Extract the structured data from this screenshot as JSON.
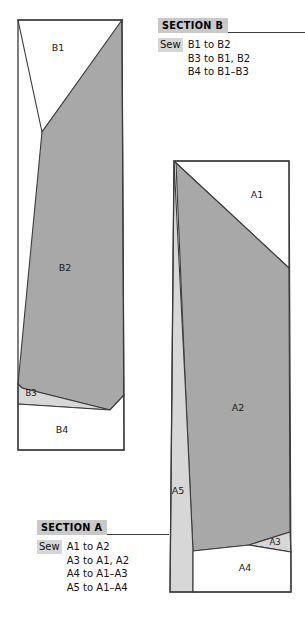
{
  "document": {
    "kind": "sewing-pattern-diagram",
    "background_color": "#ffffff"
  },
  "palette": {
    "mid_gray": "#a8a8a8",
    "light_gray": "#d7d7d7",
    "white": "#ffffff",
    "outline": "#3b3b3b",
    "title_highlight": "#c9c9c9",
    "sew_highlight": "#d6d6d6",
    "text": "#111111"
  },
  "sections": [
    {
      "id": "section-b",
      "title": "SECTION B",
      "sew_label": "Sew",
      "sew_lines": [
        "B1 to B2",
        "B3 to B1, B2",
        "B4 to B1–B3"
      ]
    },
    {
      "id": "section-a",
      "title": "SECTION A",
      "sew_label": "Sew",
      "sew_lines": [
        "A1 to A2",
        "A3 to A1, A2",
        "A4 to A1–A3",
        "A5 to A1–A4"
      ]
    }
  ],
  "pieces": {
    "b": [
      {
        "id": "B1",
        "label": "B1",
        "fill": "#ffffff",
        "label_x": 58,
        "label_y": 48
      },
      {
        "id": "B2",
        "label": "B2",
        "fill": "#a8a8a8",
        "label_x": 65,
        "label_y": 268
      },
      {
        "id": "B3",
        "label": "B3",
        "fill": "#d7d7d7",
        "label_x": 31,
        "label_y": 393
      },
      {
        "id": "B4",
        "label": "B4",
        "fill": "#ffffff",
        "label_x": 62,
        "label_y": 430
      }
    ],
    "a": [
      {
        "id": "A1",
        "label": "A1",
        "fill": "#ffffff",
        "label_x": 257,
        "label_y": 195
      },
      {
        "id": "A2",
        "label": "A2",
        "fill": "#a8a8a8",
        "label_x": 238,
        "label_y": 408
      },
      {
        "id": "A3",
        "label": "A3",
        "fill": "#d7d7d7",
        "label_x": 275,
        "label_y": 542
      },
      {
        "id": "A4",
        "label": "A4",
        "fill": "#ffffff",
        "label_x": 245,
        "label_y": 568
      },
      {
        "id": "A5",
        "label": "A5",
        "fill": "#d7d7d7",
        "label_x": 178,
        "label_y": 491
      }
    ]
  }
}
